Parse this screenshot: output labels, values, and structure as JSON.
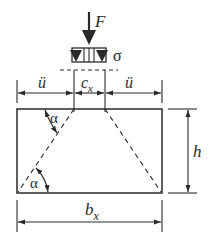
{
  "diagram": {
    "type": "footing load dispersion sketch",
    "labels": {
      "force": "F",
      "stress": "σ",
      "overhang_left": "ü",
      "overhang_right": "ü",
      "column_width": "c",
      "column_width_sub": "x",
      "height": "h",
      "base_width": "b",
      "base_width_sub": "x",
      "angle_top": "α",
      "angle_bottom": "α"
    },
    "colors": {
      "line": "#2a2a2a",
      "background": "#ffffff"
    }
  }
}
